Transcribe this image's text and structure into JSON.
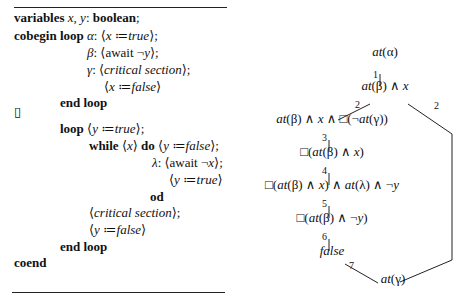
{
  "program": {
    "lines": [
      {
        "id": "vars",
        "x": 14,
        "y": 22,
        "parts": [
          [
            "kw",
            "variables"
          ],
          [
            "it",
            " x"
          ],
          [
            "",
            ","
          ],
          [
            "it",
            " y"
          ],
          [
            "",
            ": "
          ],
          [
            "kw",
            "boolean"
          ],
          [
            "",
            ";"
          ]
        ]
      },
      {
        "id": "cobegin",
        "x": 14,
        "y": 40,
        "parts": [
          [
            "kw",
            "cobegin"
          ],
          [
            "",
            " "
          ],
          [
            "kw",
            "loop"
          ],
          [
            "",
            " "
          ],
          [
            "it",
            "α"
          ],
          [
            "",
            ": ⟨"
          ],
          [
            "it",
            "x"
          ],
          [
            "",
            " ≔"
          ],
          [
            "it",
            "true"
          ],
          [
            "",
            "⟩;"
          ]
        ]
      },
      {
        "id": "beta",
        "x": 87,
        "y": 57,
        "parts": [
          [
            "it",
            "β"
          ],
          [
            "",
            ": ⟨await ¬"
          ],
          [
            "it",
            "y"
          ],
          [
            "",
            "⟩;"
          ]
        ]
      },
      {
        "id": "gamma",
        "x": 87,
        "y": 74,
        "parts": [
          [
            "it",
            "γ"
          ],
          [
            "",
            ": ⟨"
          ],
          [
            "it",
            "critical section"
          ],
          [
            "",
            "⟩;"
          ]
        ]
      },
      {
        "id": "xfalse",
        "x": 104,
        "y": 91,
        "parts": [
          [
            "",
            "⟨"
          ],
          [
            "it",
            "x"
          ],
          [
            "",
            " ≔"
          ],
          [
            "it",
            "false"
          ],
          [
            "",
            "⟩"
          ]
        ]
      },
      {
        "id": "endloop1",
        "x": 60,
        "y": 107,
        "parts": [
          [
            "kw",
            "end  loop"
          ]
        ]
      },
      {
        "id": "par",
        "x": 14,
        "y": 116,
        "parts": [
          [
            "",
            "▯"
          ]
        ]
      },
      {
        "id": "loop2",
        "x": 60,
        "y": 133,
        "parts": [
          [
            "kw",
            "loop"
          ],
          [
            "",
            " ⟨"
          ],
          [
            "it",
            "y"
          ],
          [
            "",
            " ≔"
          ],
          [
            "it",
            "true"
          ],
          [
            "",
            "⟩;"
          ]
        ]
      },
      {
        "id": "while",
        "x": 89,
        "y": 150,
        "parts": [
          [
            "kw",
            "while"
          ],
          [
            "",
            " ⟨"
          ],
          [
            "it",
            "x"
          ],
          [
            "",
            "⟩ "
          ],
          [
            "kw",
            "do"
          ],
          [
            "",
            " ⟨"
          ],
          [
            "it",
            "y"
          ],
          [
            "",
            " ≔"
          ],
          [
            "it",
            "false"
          ],
          [
            "",
            "⟩;"
          ]
        ]
      },
      {
        "id": "lambda",
        "x": 152,
        "y": 167,
        "parts": [
          [
            "it",
            "λ"
          ],
          [
            "",
            ": ⟨await ¬"
          ],
          [
            "it",
            "x"
          ],
          [
            "",
            "⟩;"
          ]
        ]
      },
      {
        "id": "ytrue",
        "x": 169,
        "y": 184,
        "parts": [
          [
            "",
            "⟨"
          ],
          [
            "it",
            "y"
          ],
          [
            "",
            " ≔"
          ],
          [
            "it",
            "true"
          ],
          [
            "",
            "⟩"
          ]
        ]
      },
      {
        "id": "od",
        "x": 150,
        "y": 201,
        "parts": [
          [
            "kw",
            "od"
          ]
        ]
      },
      {
        "id": "cs",
        "x": 89,
        "y": 217,
        "parts": [
          [
            "",
            "⟨"
          ],
          [
            "it",
            "critical section"
          ],
          [
            "",
            "⟩;"
          ]
        ]
      },
      {
        "id": "yfalse",
        "x": 89,
        "y": 234,
        "parts": [
          [
            "",
            "⟨"
          ],
          [
            "it",
            "y"
          ],
          [
            "",
            " ≔"
          ],
          [
            "it",
            "false"
          ],
          [
            "",
            "⟩"
          ]
        ]
      },
      {
        "id": "endloop2",
        "x": 60,
        "y": 251,
        "parts": [
          [
            "kw",
            "end  loop"
          ]
        ]
      },
      {
        "id": "coend",
        "x": 14,
        "y": 267,
        "parts": [
          [
            "kw",
            "coend"
          ]
        ]
      }
    ]
  },
  "diagram": {
    "nodes": [
      {
        "id": "n_alpha",
        "cx": 385,
        "y": 56,
        "html": "<i>at</i>(α)"
      },
      {
        "id": "n_beta_x",
        "cx": 385,
        "y": 90,
        "html": "<i>at</i>(β) ∧ <i>x</i>"
      },
      {
        "id": "n_beta_x_box",
        "cx": 332,
        "y": 123,
        "html": "<i>at</i>(β) ∧ <i>x</i> ∧ □(¬<i>at</i>(γ))"
      },
      {
        "id": "n_box_beta_x",
        "cx": 332,
        "y": 156,
        "html": "□(<i>at</i>(β) ∧ <i>x</i>)"
      },
      {
        "id": "n_box_lambda",
        "cx": 332,
        "y": 189,
        "html": "□(<i>at</i>(β) ∧ <i>x</i>) ∧ <i>at</i>(λ) ∧ ¬<i>y</i>"
      },
      {
        "id": "n_box_beta_noty",
        "cx": 332,
        "y": 222,
        "html": "□(<i>at</i>(β) ∧ ¬<i>y</i>)"
      },
      {
        "id": "n_false",
        "cx": 332,
        "y": 255,
        "html": "<i>false</i>"
      },
      {
        "id": "n_gamma",
        "cx": 393,
        "y": 283,
        "html": "<i>at</i>(γ)"
      }
    ],
    "labels": [
      {
        "id": "l1",
        "x": 373,
        "y": 77,
        "text": "1"
      },
      {
        "id": "l2a",
        "x": 355,
        "y": 107,
        "text": "2"
      },
      {
        "id": "l2b",
        "x": 434,
        "y": 108,
        "text": "2"
      },
      {
        "id": "l3",
        "x": 322,
        "y": 140,
        "text": "3"
      },
      {
        "id": "l4",
        "x": 322,
        "y": 173,
        "text": "4"
      },
      {
        "id": "l5",
        "x": 322,
        "y": 206,
        "text": "5"
      },
      {
        "id": "l6",
        "x": 322,
        "y": 239,
        "text": "6"
      },
      {
        "id": "l7",
        "x": 349,
        "y": 268,
        "text": "7"
      }
    ]
  }
}
